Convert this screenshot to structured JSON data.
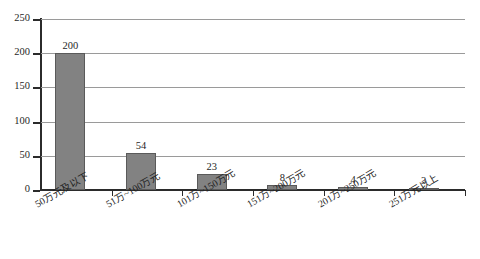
{
  "chart_data": {
    "type": "bar",
    "title": "",
    "subtitle": "",
    "xlabel": "",
    "ylabel": "",
    "categories": [
      "50万元及以下",
      "51万~100万元",
      "101万~150万元",
      "151万~200万元",
      "201万~250万元",
      "251万元以上"
    ],
    "values": [
      200,
      54,
      23,
      8,
      4,
      3
    ],
    "value_labels": [
      "200",
      "54",
      "23",
      "8",
      "4",
      "3"
    ],
    "ylim": [
      0,
      250
    ],
    "yticks": [
      0,
      50,
      100,
      150,
      200,
      250
    ],
    "ytick_labels": [
      "0",
      "50",
      "100",
      "150",
      "200",
      "250"
    ],
    "grid": true,
    "grid_axis": "y",
    "legend": false,
    "legend_position": "none",
    "series": [
      {
        "name": "",
        "values": [
          200,
          54,
          23,
          8,
          4,
          3
        ]
      }
    ]
  },
  "style": {
    "bar_fill": "#828282",
    "bar_border": "#5a5a5a",
    "gridline_color": "#9a9a9a",
    "axis_color": "#2b2b2b",
    "text_color": "#1f1f1f",
    "background": "#ffffff"
  }
}
